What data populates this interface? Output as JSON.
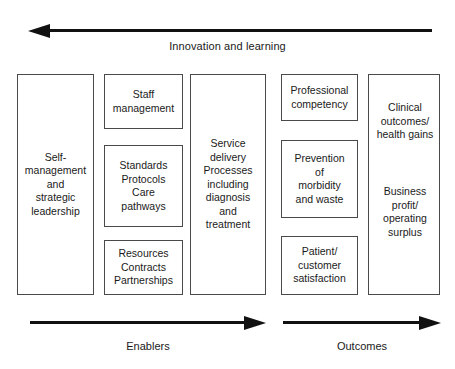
{
  "diagram": {
    "top_arrow": {
      "label": "Innovation and learning",
      "direction": "left"
    },
    "columns": [
      {
        "id": "col1",
        "type": "tall",
        "boxes": [
          {
            "text": "Self-\nmanagement\nand\nstrategic\nleadership"
          }
        ]
      },
      {
        "id": "col2",
        "type": "stack",
        "boxes": [
          {
            "text": "Staff\nmanagement"
          },
          {
            "text": "Standards\nProtocols\nCare\npathways"
          },
          {
            "text": "Resources\nContracts\nPartnerships"
          }
        ]
      },
      {
        "id": "col3",
        "type": "tall",
        "boxes": [
          {
            "text": "Service\ndelivery\nProcesses\nincluding\ndiagnosis\nand\ntreatment"
          }
        ]
      },
      {
        "id": "col4",
        "type": "stack",
        "boxes": [
          {
            "text": "Professional\ncompetency"
          },
          {
            "text": "Prevention\nof\nmorbidity\nand waste"
          },
          {
            "text": "Patient/\ncustomer\nsatisfaction"
          }
        ]
      },
      {
        "id": "col5",
        "type": "tall-segmented",
        "boxes": [
          {
            "text": "Clinical\noutcomes/\nhealth gains"
          },
          {
            "text": "Business\nprofit/\noperating\nsurplus"
          }
        ]
      }
    ],
    "bottom_arrows": [
      {
        "label": "Enablers",
        "direction": "right"
      },
      {
        "label": "Outcomes",
        "direction": "right"
      }
    ],
    "colors": {
      "arrow": "#111111",
      "box_border": "#4a4a4a",
      "text": "#1a1a1a",
      "background": "#ffffff"
    }
  }
}
